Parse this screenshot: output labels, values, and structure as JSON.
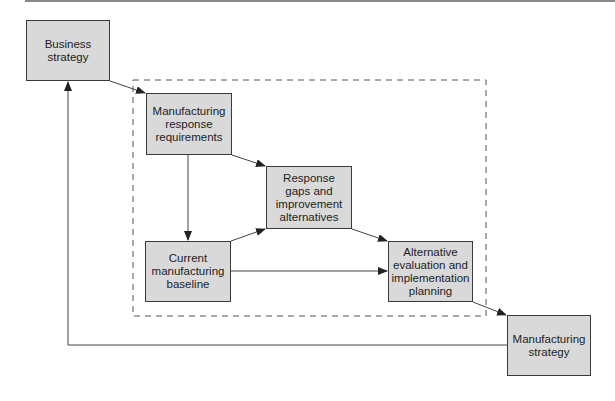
{
  "diagram": {
    "type": "flowchart",
    "colors": {
      "box_fill": "#d9d9d9",
      "box_border": "#3a3a3a",
      "line": "#444444",
      "frame": "#555555"
    },
    "nodes": [
      {
        "id": "business_strategy",
        "label": "Business\nstrategy"
      },
      {
        "id": "mfg_response_requirements",
        "label": "Manufacturing\nresponse\nrequirements"
      },
      {
        "id": "response_gaps",
        "label": "Response\ngaps and\nimprovement\nalternatives"
      },
      {
        "id": "current_baseline",
        "label": "Current\nmanufacturing\nbaseline"
      },
      {
        "id": "alternative_evaluation",
        "label": "Alternative\nevaluation and\nimplementation\nplanning"
      },
      {
        "id": "mfg_strategy",
        "label": "Manufacturing\nstrategy"
      }
    ],
    "edges": [
      {
        "from": "business_strategy",
        "to": "mfg_response_requirements"
      },
      {
        "from": "mfg_response_requirements",
        "to": "response_gaps"
      },
      {
        "from": "mfg_response_requirements",
        "to": "current_baseline"
      },
      {
        "from": "current_baseline",
        "to": "response_gaps"
      },
      {
        "from": "current_baseline",
        "to": "alternative_evaluation"
      },
      {
        "from": "response_gaps",
        "to": "alternative_evaluation"
      },
      {
        "from": "alternative_evaluation",
        "to": "mfg_strategy"
      },
      {
        "from": "mfg_strategy",
        "to": "business_strategy",
        "style": "feedback"
      }
    ],
    "groups": [
      {
        "id": "dashed_frame",
        "style": "dashed",
        "contains": [
          "mfg_response_requirements",
          "response_gaps",
          "current_baseline",
          "alternative_evaluation"
        ]
      }
    ]
  }
}
